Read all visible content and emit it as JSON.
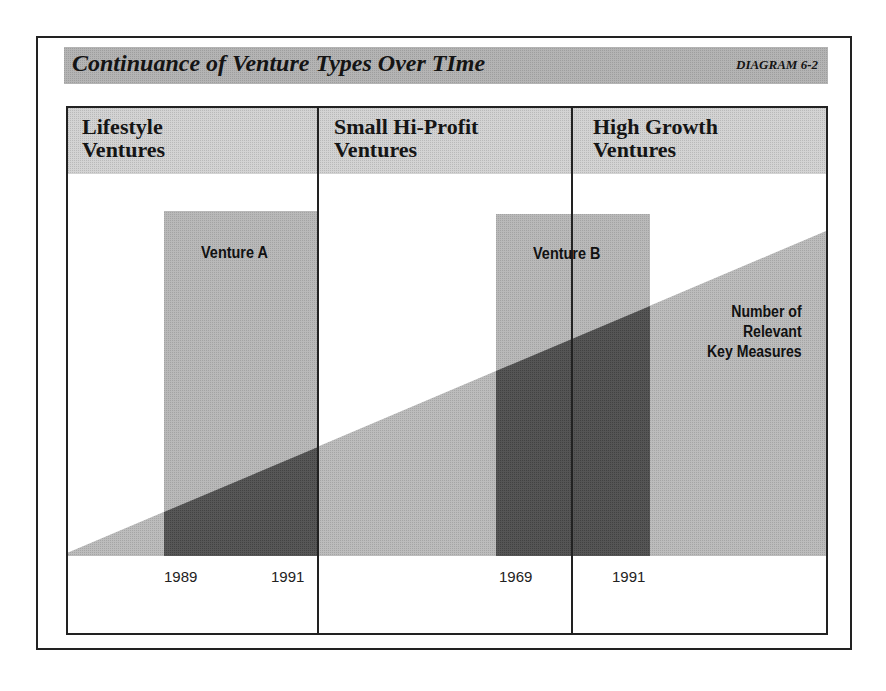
{
  "title": {
    "text": "Continuance of Venture Types Over TIme",
    "tag": "DIAGRAM 6-2"
  },
  "columns": [
    {
      "label_line1": "Lifestyle",
      "label_line2": "Ventures"
    },
    {
      "label_line1": "Small Hi-Profit",
      "label_line2": "Ventures"
    },
    {
      "label_line1": "High Growth",
      "label_line2": "Ventures"
    }
  ],
  "ventures": [
    {
      "label": "Venture A",
      "start_label": "1989",
      "end_label": "1991"
    },
    {
      "label": "Venture B",
      "start_label": "1969",
      "end_label": "1991"
    }
  ],
  "wedge": {
    "label_line1": "Number of",
    "label_line2": "Relevant",
    "label_line3": "Key Measures"
  },
  "colors": {
    "title_band": "#b4b4b4",
    "header_band": "#d3d3d3",
    "light_fill": "#b9b9b9",
    "dark_overlap": "#575757",
    "line": "#222222"
  }
}
